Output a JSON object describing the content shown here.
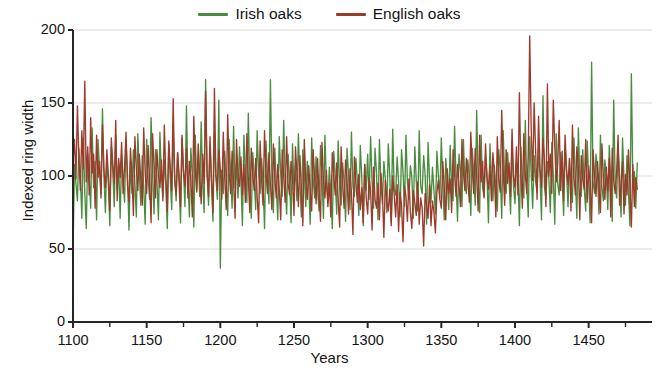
{
  "legend": {
    "position": "top-center",
    "entries": [
      {
        "label": "Irish oaks",
        "color": "#4a8c3f",
        "icon": "line-swatch-icon"
      },
      {
        "label": "English oaks",
        "color": "#9c3a2b",
        "icon": "line-swatch-icon"
      }
    ]
  },
  "axes": {
    "x_title": "Years",
    "y_title": "Indexed ring width",
    "x_tick_labels": [
      "1100",
      "1150",
      "1200",
      "1250",
      "1300",
      "1350",
      "1400",
      "1450"
    ],
    "y_tick_labels": [
      "0",
      "50",
      "100",
      "150",
      "200"
    ]
  },
  "colors": {
    "irish": "#4a8c3f",
    "english": "#9c3a2b",
    "gridline": "#d9d9d9",
    "axis": "#262626",
    "background": "#ffffff",
    "text": "#141414"
  },
  "chart_data": {
    "type": "line",
    "title": "",
    "subtitle": "",
    "xlabel": "Years",
    "ylabel": "Indexed ring width",
    "xlim": [
      1100,
      1493
    ],
    "ylim": [
      0,
      200
    ],
    "xticks": [
      1100,
      1150,
      1200,
      1250,
      1300,
      1350,
      1400,
      1450
    ],
    "xticks_minor_step": 25,
    "yticks": [
      0,
      50,
      100,
      150,
      200
    ],
    "grid": "horizontal",
    "legend_position": "top-center",
    "annotations": [],
    "series": [
      {
        "name": "Irish oaks",
        "color": "#4a8c3f",
        "x_start": 1100,
        "x_step": 1,
        "values": [
          47,
          108,
          95,
          83,
          119,
          100,
          71,
          126,
          88,
          64,
          115,
          99,
          78,
          133,
          92,
          110,
          70,
          125,
          103,
          88,
          146,
          100,
          75,
          112,
          95,
          66,
          120,
          104,
          79,
          128,
          90,
          108,
          71,
          115,
          97,
          82,
          124,
          100,
          63,
          110,
          88,
          118,
          95,
          72,
          129,
          102,
          80,
          114,
          92,
          67,
          125,
          98,
          84,
          140,
          105,
          74,
          118,
          96,
          70,
          130,
          100,
          86,
          111,
          93,
          64,
          122,
          99,
          77,
          134,
          101,
          83,
          116,
          94,
          68,
          126,
          103,
          79,
          148,
          97,
          72,
          119,
          100,
          65,
          128,
          91,
          113,
          86,
          137,
          98,
          75,
          166,
          102,
          80,
          121,
          95,
          69,
          130,
          99,
          84,
          152,
          37,
          104,
          88,
          117,
          96,
          73,
          125,
          101,
          78,
          134,
          92,
          109,
          85,
          120,
          97,
          66,
          128,
          100,
          82,
          143,
          94,
          71,
          116,
          99,
          77,
          131,
          102,
          88,
          112,
          95,
          64,
          124,
          100,
          81,
          166,
          98,
          75,
          119,
          93,
          70,
          127,
          101,
          86,
          138,
          97,
          74,
          115,
          99,
          68,
          122,
          90,
          107,
          83,
          129,
          96,
          72,
          118,
          102,
          79,
          110,
          94,
          67,
          126,
          98,
          85,
          113,
          91,
          76,
          121,
          100,
          71,
          128,
          95,
          82,
          106,
          88,
          64,
          117,
          99,
          74,
          124,
          92,
          80,
          109,
          96,
          69,
          119,
          101,
          77,
          130,
          93,
          86,
          112,
          97,
          73,
          121,
          99,
          66,
          108,
          90,
          115,
          84,
          127,
          96,
          78,
          119,
          102,
          70,
          125,
          94,
          81,
          110,
          98,
          75,
          122,
          100,
          68,
          132,
          91,
          87,
          113,
          96,
          72,
          118,
          103,
          79,
          128,
          95,
          84,
          107,
          99,
          71,
          120,
          97,
          76,
          131,
          93,
          88,
          114,
          101,
          67,
          123,
          98,
          82,
          106,
          90,
          74,
          117,
          100,
          85,
          126,
          95,
          70,
          112,
          99,
          77,
          121,
          92,
          83,
          134,
          97,
          69,
          115,
          104,
          79,
          125,
          94,
          88,
          111,
          98,
          73,
          119,
          101,
          80,
          145,
          96,
          75,
          128,
          92,
          86,
          113,
          100,
          68,
          122,
          99,
          83,
          107,
          91,
          76,
          118,
          103,
          71,
          131,
          95,
          88,
          116,
          98,
          74,
          124,
          93,
          81,
          109,
          100,
          66,
          120,
          97,
          85,
          138,
          94,
          72,
          127,
          102,
          78,
          114,
          96,
          89,
          119,
          100,
          70,
          155,
          93,
          84,
          110,
          98,
          75,
          123,
          101,
          67,
          129,
          95,
          87,
          116,
          99,
          73,
          121,
          103,
          79,
          112,
          94,
          82,
          126,
          97,
          71,
          133,
          100,
          86,
          118,
          92,
          76,
          124,
          99,
          68,
          178,
          96,
          88,
          115,
          102,
          74,
          128,
          93,
          83,
          111,
          100,
          77,
          121,
          97,
          69,
          152,
          95,
          85,
          119,
          101,
          72,
          126,
          98,
          80,
          114,
          90,
          66,
          170,
          96,
          103,
          78,
          109
        ]
      },
      {
        "name": "English oaks",
        "color": "#9c3a2b",
        "x_start": 1100,
        "x_step": 1,
        "values": [
          110,
          125,
          98,
          148,
          112,
          90,
          131,
          105,
          165,
          96,
          120,
          87,
          140,
          102,
          115,
          78,
          128,
          99,
          110,
          85,
          135,
          104,
          92,
          118,
          100,
          76,
          126,
          108,
          95,
          138,
          83,
          112,
          99,
          123,
          88,
          107,
          130,
          94,
          82,
          119,
          101,
          73,
          127,
          105,
          90,
          115,
          98,
          80,
          133,
          102,
          88,
          121,
          96,
          68,
          129,
          107,
          85,
          118,
          100,
          92,
          111,
          83,
          135,
          99,
          76,
          124,
          106,
          90,
          153,
          97,
          87,
          116,
          101,
          79,
          128,
          103,
          93,
          119,
          85,
          110,
          98,
          72,
          141,
          104,
          89,
          122,
          100,
          81,
          115,
          95,
          158,
          103,
          86,
          127,
          98,
          75,
          160,
          101,
          90,
          118,
          105,
          84,
          130,
          99,
          77,
          142,
          102,
          88,
          117,
          96,
          71,
          125,
          100,
          93,
          113,
          87,
          108,
          82,
          129,
          98,
          75,
          119,
          101,
          90,
          112,
          86,
          68,
          124,
          97,
          80,
          131,
          103,
          88,
          116,
          94,
          77,
          122,
          99,
          85,
          108,
          91,
          70,
          118,
          100,
          82,
          127,
          95,
          87,
          110,
          98,
          73,
          120,
          102,
          79,
          114,
          92,
          66,
          125,
          96,
          84,
          107,
          90,
          76,
          118,
          99,
          81,
          112,
          88,
          69,
          123,
          97,
          85,
          104,
          79,
          95,
          72,
          116,
          100,
          87,
          109,
          83,
          65,
          120,
          94,
          78,
          111,
          98,
          74,
          105,
          88,
          60,
          113,
          96,
          82,
          101,
          77,
          92,
          68,
          108,
          85,
          74,
          99,
          90,
          63,
          106,
          84,
          78,
          95,
          70,
          102,
          88,
          58,
          97,
          83,
          76,
          91,
          66,
          100,
          87,
          72,
          94,
          62,
          89,
          80,
          55,
          93,
          86,
          69,
          98,
          75,
          64,
          90,
          82,
          73,
          96,
          67,
          85,
          78,
          52,
          88,
          80,
          71,
          94,
          66,
          83,
          75,
          61,
          89,
          97,
          84,
          78,
          110,
          92,
          70,
          105,
          88,
          98,
          75,
          118,
          101,
          86,
          108,
          94,
          79,
          125,
          103,
          90,
          112,
          97,
          82,
          130,
          105,
          88,
          119,
          100,
          76,
          128,
          96,
          110,
          85,
          122,
          99,
          91,
          107,
          83,
          116,
          102,
          72,
          127,
          98,
          89,
          145,
          104,
          80,
          118,
          95,
          109,
          86,
          132,
          100,
          92,
          120,
          87,
          157,
          103,
          78,
          129,
          101,
          88,
          114,
          196,
          133,
          97,
          150,
          118,
          84,
          141,
          105,
          92,
          126,
          111,
          79,
          163,
          100,
          115,
          88,
          152,
          121,
          96,
          108,
          138,
          90,
          117,
          83,
          128,
          104,
          94,
          112,
          76,
          135,
          99,
          87,
          120,
          106,
          70,
          114,
          98,
          91,
          125,
          82,
          107,
          96,
          68,
          118,
          100,
          86,
          110,
          93,
          75,
          122,
          99,
          84,
          106,
          90,
          112,
          72,
          119,
          97,
          88,
          103,
          128,
          80,
          95,
          110,
          74,
          101,
          87,
          118,
          93,
          65,
          108,
          79,
          99,
          91
        ]
      }
    ]
  }
}
